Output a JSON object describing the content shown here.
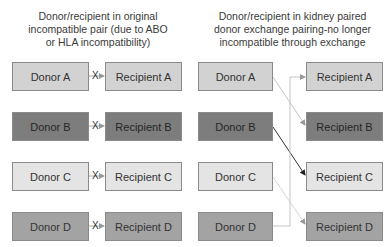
{
  "left_header": {
    "lines": [
      "Donor/recipient in original",
      "incompatible pair (due to ABO",
      "or HLA incompatibility)"
    ]
  },
  "right_header": {
    "lines": [
      "Donor/recipient in kidney paired",
      "donor exchange pairing-no longer",
      "incompatible through exchange"
    ]
  },
  "left_pairs": [
    {
      "donor": "Donor A",
      "recipient": "Recipient A",
      "mark": "X"
    },
    {
      "donor": "Donor B",
      "recipient": "Recipient B",
      "mark": "X"
    },
    {
      "donor": "Donor C",
      "recipient": "Recipient C",
      "mark": "X"
    },
    {
      "donor": "Donor D",
      "recipient": "Recipient D",
      "mark": "X"
    }
  ],
  "right_donors": [
    "Donor A",
    "Donor B",
    "Donor C",
    "Donor D"
  ],
  "right_recipients": [
    "Recipient A",
    "Recipient B",
    "Recipient C",
    "Recipient D"
  ],
  "exchanges": [
    {
      "from": "Donor A",
      "to": "Recipient B"
    },
    {
      "from": "Donor B",
      "to": "Recipient C"
    },
    {
      "from": "Donor C",
      "to": "Recipient D"
    },
    {
      "from": "Donor D",
      "to": "Recipient A"
    }
  ],
  "colors": {
    "pair_a": "#d2d2d2",
    "pair_b": "#7d7d7d",
    "pair_c": "#e4e4e4",
    "pair_d": "#a3a3a3"
  }
}
